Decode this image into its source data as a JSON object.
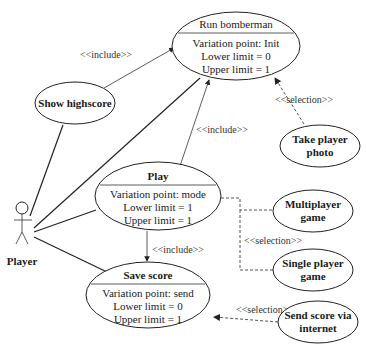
{
  "actor": {
    "label": "Player"
  },
  "use_cases": {
    "run_bomberman": {
      "title": "Run bomberman",
      "variation_point": "Variation point: Init",
      "lower_limit": "Lower limit = 0",
      "upper_limit": "Upper limit = 1"
    },
    "show_highscore": {
      "title": "Show highscore"
    },
    "play": {
      "title": "Play",
      "variation_point": "Variation point: mode",
      "lower_limit": "Lower limit = 1",
      "upper_limit": "Upper limit = 1"
    },
    "save_score": {
      "title": "Save score",
      "variation_point": "Variation point: send",
      "lower_limit": "Lower limit = 0",
      "upper_limit": "Upper limit = 1"
    },
    "take_player_photo": {
      "line1": "Take player",
      "line2": "photo"
    },
    "multiplayer_game": {
      "line1": "Multiplayer",
      "line2": "game"
    },
    "single_player_game": {
      "line1": "Single player",
      "line2": "game"
    },
    "send_score_via_internet": {
      "line1": "Send score via",
      "line2": "internet"
    }
  },
  "relations": {
    "show_highscore_include": "<<include>>",
    "play_include_run": "<<include>>",
    "take_photo_selection": "<<selection>>",
    "play_mode_selection": "<<selection>>",
    "play_include_save": "<<include>>",
    "send_score_selection": "<<selection>>"
  }
}
